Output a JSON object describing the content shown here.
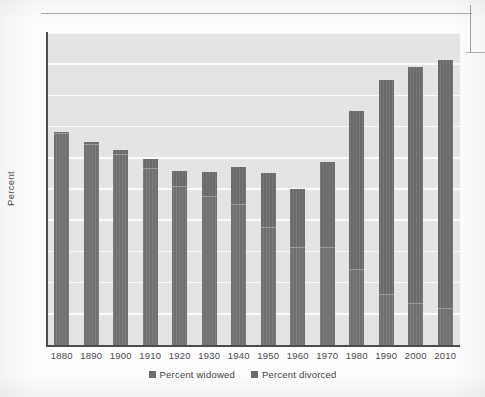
{
  "chart_data": {
    "type": "bar",
    "subtype": "stacked-bar",
    "title": "",
    "xlabel": "",
    "ylabel": "Percent",
    "ylim": [
      0,
      20
    ],
    "ytick_step": 2,
    "yticks": [
      0,
      2,
      4,
      6,
      8,
      10,
      12,
      14,
      16,
      18,
      20
    ],
    "grid": true,
    "grid_axis": "y",
    "legend_position": "bottom-center",
    "categories": [
      "1880",
      "1890",
      "1900",
      "1910",
      "1920",
      "1930",
      "1940",
      "1950",
      "1960",
      "1970",
      "1980",
      "1990",
      "2000",
      "2010"
    ],
    "series": [
      {
        "name": "Percent widowed",
        "color": "#6f6f6f",
        "values": [
          13.5,
          12.8,
          12.2,
          11.3,
          10.1,
          9.5,
          9.0,
          7.5,
          6.2,
          6.2,
          4.8,
          3.2,
          2.6,
          2.3
        ]
      },
      {
        "name": "Percent divorced",
        "color": "#6a6a6a",
        "values": [
          0.15,
          0.2,
          0.3,
          0.6,
          1.05,
          1.6,
          2.4,
          3.5,
          3.8,
          5.5,
          10.2,
          13.8,
          15.2,
          16.0
        ]
      }
    ],
    "totals": [
      13.65,
      13.0,
      12.5,
      11.9,
      11.15,
      11.1,
      11.4,
      11.0,
      10.0,
      11.7,
      15.0,
      17.0,
      17.8,
      18.3
    ]
  },
  "legend": {
    "items": [
      {
        "label": "Percent widowed",
        "color": "#6f6f6f"
      },
      {
        "label": "Percent divorced",
        "color": "#6a6a6a"
      }
    ]
  },
  "axes": {
    "y_title": "Percent"
  }
}
